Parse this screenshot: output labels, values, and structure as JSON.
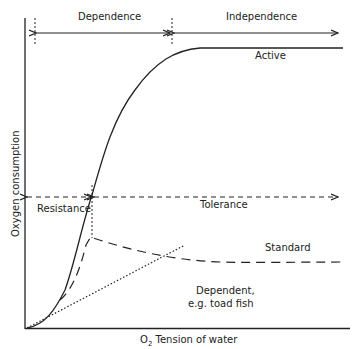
{
  "diagram": {
    "axes": {
      "x_label_prefix": "O",
      "x_label_sub": "2",
      "x_label_suffix": " Tension of water",
      "y_label": "Oxygen consumption"
    },
    "regions_top": [
      {
        "label": "Dependence"
      },
      {
        "label": "Independence"
      }
    ],
    "regions_mid": [
      {
        "label": "Resistance"
      },
      {
        "label": "Tolerance"
      }
    ],
    "curves": [
      {
        "label": "Active",
        "style": "solid"
      },
      {
        "label": "Standard",
        "style": "dashed"
      },
      {
        "label_line1": "Dependent,",
        "label_line2": "e.g. toad fish",
        "style": "dotted"
      }
    ],
    "colors": {
      "line": "#222222",
      "background": "#ffffff"
    }
  }
}
